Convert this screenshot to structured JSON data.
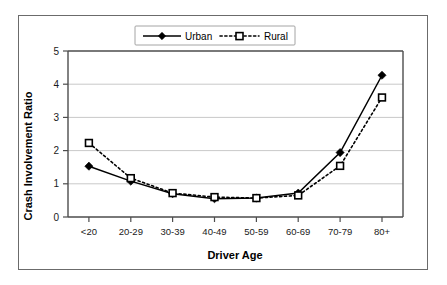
{
  "chart_data": {
    "type": "line",
    "title": "",
    "xlabel": "Driver Age",
    "ylabel": "Crash Involvement Ratio",
    "categories": [
      "<20",
      "20-29",
      "30-39",
      "40-49",
      "50-59",
      "60-69",
      "70-79",
      "80+"
    ],
    "series": [
      {
        "name": "Urban",
        "marker": "diamond",
        "line_style": "solid",
        "color": "#000000",
        "values": [
          1.53,
          1.08,
          0.7,
          0.55,
          0.57,
          0.72,
          1.94,
          4.27
        ]
      },
      {
        "name": "Rural",
        "marker": "square",
        "line_style": "dotted",
        "color": "#000000",
        "values": [
          2.23,
          1.17,
          0.72,
          0.6,
          0.57,
          0.65,
          1.54,
          3.6
        ]
      }
    ],
    "ylim": [
      0,
      5
    ],
    "yticks": [
      0,
      1,
      2,
      3,
      4,
      5
    ],
    "ytick_labels": [
      "0",
      "1",
      "2",
      "3",
      "4",
      "5"
    ],
    "grid": true,
    "grid_axis": "y",
    "legend_position": "top-center",
    "legend_entries": [
      "Urban",
      "Rural"
    ]
  }
}
